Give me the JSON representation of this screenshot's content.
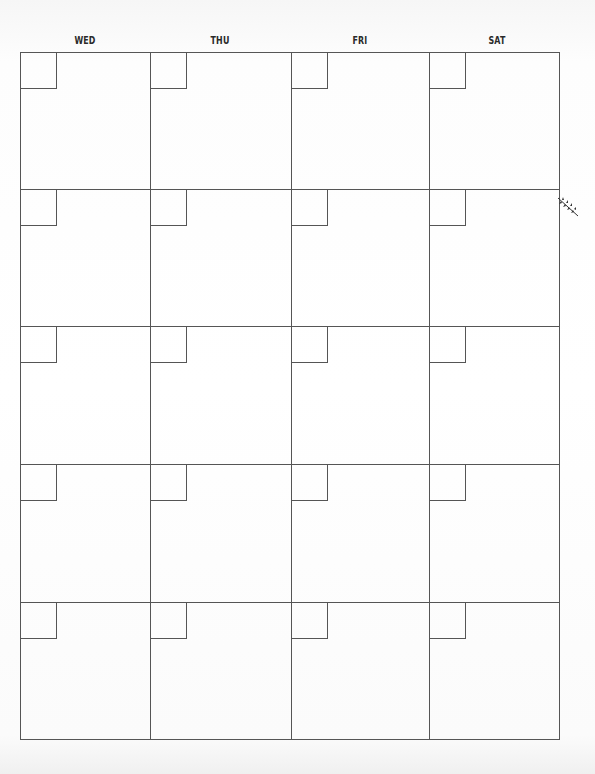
{
  "calendar": {
    "days": [
      "WED",
      "THU",
      "FRI",
      "SAT"
    ],
    "rows": 5,
    "columns": 4,
    "line_color": "#555555",
    "ornament": "leaf-sprig"
  }
}
